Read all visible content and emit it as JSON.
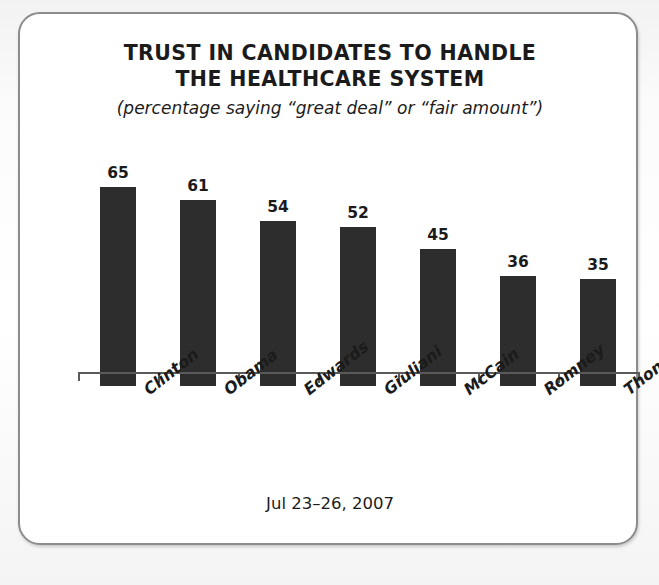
{
  "card": {
    "title_lines": [
      "TRUST IN CANDIDATES TO HANDLE",
      "THE HEALTHCARE SYSTEM"
    ],
    "subtitle": "(percentage saying “great deal” or “fair amount”)",
    "footer": "Jul 23–26, 2007",
    "border_color": "#8c8c8c",
    "background_color": "#ffffff"
  },
  "chart_data": {
    "type": "bar",
    "title": "TRUST IN CANDIDATES TO HANDLE THE HEALTHCARE SYSTEM",
    "subtitle": "(percentage saying “great deal” or “fair amount”)",
    "categories": [
      "Clinton",
      "Obama",
      "Edwards",
      "Giuliani",
      "McCain",
      "Romney",
      "Thompson"
    ],
    "values": [
      65,
      61,
      54,
      52,
      45,
      36,
      35
    ],
    "value_labels": [
      "65",
      "61",
      "54",
      "52",
      "45",
      "36",
      "35"
    ],
    "xlabel": "",
    "ylabel": "",
    "ylim": [
      0,
      72
    ],
    "grid": false,
    "legend": false,
    "bar_color": "#2d2d2d",
    "axis_color": "#5a5a5a",
    "note": "Jul 23–26, 2007"
  }
}
